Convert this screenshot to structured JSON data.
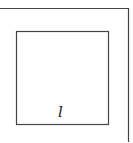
{
  "diagram": {
    "type": "nested-squares",
    "stroke_color": "#444444",
    "background": "#ffffff",
    "outer_square": {
      "top_y": 8,
      "right_x": 128,
      "cropped": true
    },
    "inner_square": {
      "x": 16,
      "y": 31,
      "width": 92,
      "height": 93,
      "label": "l"
    }
  }
}
